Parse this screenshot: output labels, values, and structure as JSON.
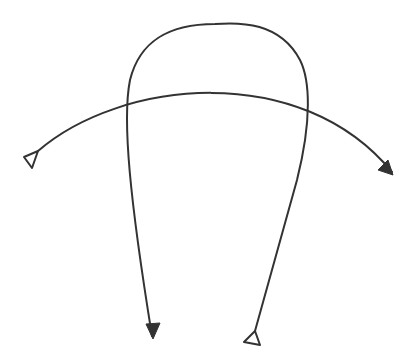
{
  "diagram": {
    "background": "#ffffff",
    "stroke_color": "#333333",
    "stroke_width": 2,
    "paths": [
      {
        "name": "horizontal-arc",
        "d": "M 38 151 C 120 80, 300 60, 392 172",
        "start_marker": "open-triangle",
        "end_marker": "filled-arrow"
      },
      {
        "name": "arch-loop",
        "d": "M 255 331 L 297 180 C 312 120, 310 80, 300 60 C 280 22, 240 22, 215 24 C 170 24, 140 40, 130 80 C 122 120, 130 200, 152 336",
        "start_marker": "open-triangle",
        "end_marker": "filled-arrow"
      }
    ],
    "markers": {
      "open_triangles": [
        {
          "name": "arc-start-triangle",
          "points": "24,157 38,151 32,168"
        },
        {
          "name": "loop-start-triangle",
          "points": "255,331 244,342 260,345"
        }
      ],
      "filled_arrows": [
        {
          "name": "arc-end-arrow",
          "points": "393,175 378,170 388,160"
        },
        {
          "name": "loop-end-arrow",
          "points": "153,339 146,324 160,323"
        }
      ]
    }
  }
}
